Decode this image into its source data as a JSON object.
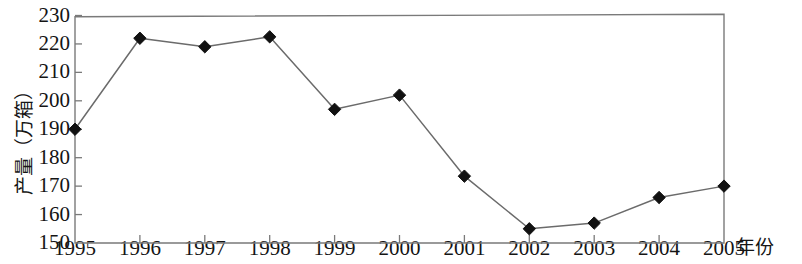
{
  "chart_data": {
    "type": "line",
    "title": "",
    "xlabel": "年份",
    "ylabel": "产量（万箱）",
    "categories": [
      "1995",
      "1996",
      "1997",
      "1998",
      "1999",
      "2000",
      "2001",
      "2002",
      "2003",
      "2004",
      "2005"
    ],
    "values": [
      190,
      222,
      219,
      222.5,
      197,
      202,
      173.5,
      155,
      157,
      166,
      170
    ],
    "series": [
      {
        "name": "产量",
        "values": [
          190,
          222,
          219,
          222.5,
          197,
          202,
          173.5,
          155,
          157,
          166,
          170
        ]
      }
    ],
    "ylim": [
      150,
      230
    ],
    "ytick_step": 10,
    "yticks": [
      150,
      160,
      170,
      180,
      190,
      200,
      210,
      220,
      230
    ],
    "xticks": [
      "1995",
      "1996",
      "1997",
      "1998",
      "1999",
      "2000",
      "2001",
      "2002",
      "2003",
      "2004",
      "2005"
    ],
    "grid": false,
    "legend": null,
    "marker": "diamond",
    "line_color": "#6b6b6b",
    "marker_color": "#111111",
    "axis_color": "#7a7a7a"
  }
}
